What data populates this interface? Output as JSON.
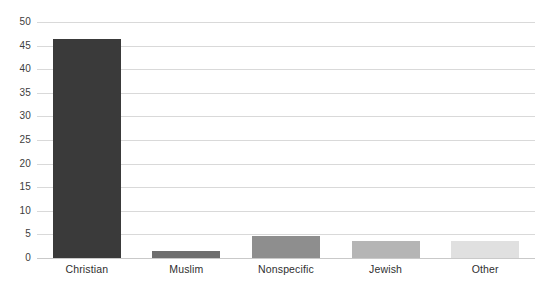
{
  "chart_data": {
    "type": "bar",
    "title": "",
    "xlabel": "",
    "ylabel": "",
    "categories": [
      "Christian",
      "Muslim",
      "Nonspecific",
      "Jewish",
      "Other"
    ],
    "values": [
      46.5,
      1.5,
      4.7,
      3.7,
      3.5
    ],
    "bar_colors": [
      "#3a3a3a",
      "#6e6e6e",
      "#8e8e8e",
      "#b5b5b5",
      "#e0e0e0"
    ],
    "ylim": [
      0,
      50
    ],
    "ytick_step": 5,
    "ytick_labels": [
      "50",
      "45",
      "40",
      "35",
      "30",
      "25",
      "20",
      "15",
      "10",
      "5",
      "0"
    ],
    "ytick_values": [
      50,
      45,
      40,
      35,
      30,
      25,
      20,
      15,
      10,
      5,
      0
    ],
    "grid": true,
    "grid_color": "#d9d9d9",
    "legend": false,
    "legend_position": "none",
    "background": "#ffffff",
    "series": [
      {
        "name": "",
        "values": [
          46.5,
          1.5,
          4.7,
          3.7,
          3.5
        ]
      }
    ]
  }
}
